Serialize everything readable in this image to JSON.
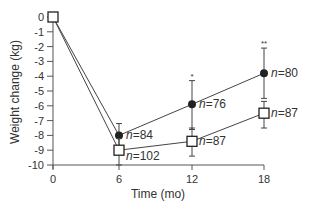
{
  "chart_data": {
    "type": "line",
    "title": "",
    "xlabel": "Time (mo)",
    "ylabel": "Weight change (kg)",
    "x": [
      0,
      6,
      12,
      18
    ],
    "xticks": [
      "0",
      "6",
      "12",
      "18"
    ],
    "yticks": [
      "0",
      "-1",
      "-2",
      "-3",
      "-4",
      "-5",
      "-6",
      "-7",
      "-8",
      "-9",
      "-10"
    ],
    "xlim": [
      0,
      18
    ],
    "ylim": [
      -10,
      0
    ],
    "grid": false,
    "legend": null,
    "series": [
      {
        "name": "filled-circle group",
        "marker": "filled-circle",
        "values": [
          0,
          -8.0,
          -5.9,
          -3.8
        ],
        "error_low": [
          null,
          -9.0,
          -7.6,
          -5.5
        ],
        "error_high": [
          null,
          -7.2,
          -4.3,
          -2.1
        ],
        "n_labels": [
          "",
          "n=84",
          "n=76",
          "n=80"
        ],
        "significance": [
          "",
          "",
          "*",
          "**"
        ]
      },
      {
        "name": "open-square group",
        "marker": "open-square",
        "values": [
          0,
          -9.0,
          -8.4,
          -6.5
        ],
        "error_low": [
          null,
          -10.0,
          -9.4,
          -7.5
        ],
        "error_high": [
          null,
          -8.2,
          -7.5,
          -5.7
        ],
        "n_labels": [
          "",
          "n=102",
          "n=87",
          "n=87"
        ],
        "significance": [
          "",
          "",
          "",
          ""
        ]
      }
    ],
    "colors": {
      "line": "#444444",
      "marker": "#222222",
      "axis": "#555555",
      "text": "#333333"
    }
  }
}
